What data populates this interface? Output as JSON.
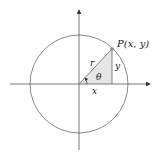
{
  "diagram": {
    "labels": {
      "point": "P(x, y)",
      "radius": "r",
      "angle": "θ",
      "x_leg": "x",
      "y_leg": "y"
    },
    "colors": {
      "circle": "#8a8a8a",
      "axes": "#555555",
      "triangle_fill": "#e6e6e6",
      "point": "#8a8a8a"
    }
  }
}
